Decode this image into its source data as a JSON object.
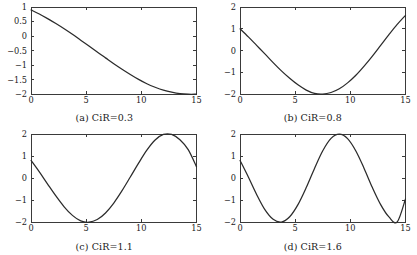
{
  "figure": {
    "panel_count": 4,
    "line_color": "#2b2b2b",
    "frame_color": "#3a3a3a",
    "background": "#ffffff"
  },
  "chart_data": [
    {
      "type": "line",
      "panel": "a",
      "title": "(a) CiR=0.3",
      "xlabel": "",
      "ylabel": "",
      "xlim": [
        0,
        15
      ],
      "ylim": [
        -2,
        1
      ],
      "xticks": [
        0,
        5,
        10,
        15
      ],
      "xticklabels": [
        "0",
        "5",
        "10",
        "15"
      ],
      "yticks": [
        1,
        0.5,
        0,
        -0.5,
        -1,
        -1.5,
        -2
      ],
      "yticklabels": [
        "1",
        "0.5",
        "0",
        "-0.5",
        "-1",
        "-1.5",
        "-2"
      ],
      "grid": false,
      "legend": null,
      "series": [
        {
          "name": "CiR=0.3",
          "x": [
            0,
            0.75,
            1.5,
            2.25,
            3,
            3.75,
            4.5,
            5.25,
            6,
            6.75,
            7.5,
            8.25,
            9,
            9.75,
            10.5,
            11.25,
            12,
            12.75,
            13.5,
            14.25,
            15
          ],
          "values": [
            0.9,
            0.76,
            0.6,
            0.43,
            0.25,
            0.06,
            -0.14,
            -0.34,
            -0.55,
            -0.75,
            -0.95,
            -1.14,
            -1.32,
            -1.49,
            -1.64,
            -1.76,
            -1.86,
            -1.93,
            -1.98,
            -2.0,
            -2.0
          ]
        }
      ]
    },
    {
      "type": "line",
      "panel": "b",
      "title": "(b) CiR=0.8",
      "xlabel": "",
      "ylabel": "",
      "xlim": [
        0,
        15
      ],
      "ylim": [
        -2,
        2
      ],
      "xticks": [
        0,
        5,
        10,
        15
      ],
      "xticklabels": [
        "0",
        "5",
        "10",
        "15"
      ],
      "yticks": [
        2,
        1,
        0,
        -1,
        -2
      ],
      "yticklabels": [
        "2",
        "1",
        "0",
        "-1",
        "-2"
      ],
      "grid": false,
      "legend": null,
      "series": [
        {
          "name": "CiR=0.8",
          "x": [
            0,
            0.75,
            1.5,
            2.25,
            3,
            3.75,
            4.5,
            5.25,
            6,
            6.75,
            7.5,
            8.25,
            9,
            9.75,
            10.5,
            11.25,
            12,
            12.75,
            13.5,
            14.25,
            15
          ],
          "values": [
            1.0,
            0.63,
            0.24,
            -0.15,
            -0.55,
            -0.93,
            -1.27,
            -1.57,
            -1.81,
            -1.96,
            -1.99,
            -1.92,
            -1.75,
            -1.48,
            -1.13,
            -0.71,
            -0.25,
            0.24,
            0.73,
            1.2,
            1.62
          ]
        }
      ]
    },
    {
      "type": "line",
      "panel": "c",
      "title": "(c) CiR=1.1",
      "xlabel": "",
      "ylabel": "",
      "xlim": [
        0,
        15
      ],
      "ylim": [
        -2,
        2
      ],
      "xticks": [
        0,
        5,
        10,
        15
      ],
      "xticklabels": [
        "0",
        "5",
        "10",
        "15"
      ],
      "yticks": [
        2,
        1,
        0,
        -1,
        -2
      ],
      "yticklabels": [
        "2",
        "1",
        "0",
        "-1",
        "-2"
      ],
      "grid": false,
      "legend": null,
      "series": [
        {
          "name": "CiR=1.1",
          "x": [
            0,
            0.75,
            1.5,
            2.25,
            3,
            3.75,
            4.5,
            5.25,
            6,
            6.75,
            7.5,
            8.25,
            9,
            9.75,
            10.5,
            11.25,
            12,
            12.75,
            13.5,
            14.25,
            15
          ],
          "values": [
            0.8,
            0.28,
            -0.27,
            -0.81,
            -1.3,
            -1.69,
            -1.94,
            -2.0,
            -1.88,
            -1.58,
            -1.13,
            -0.57,
            0.05,
            0.68,
            1.27,
            1.73,
            1.98,
            1.98,
            1.74,
            1.29,
            0.52
          ]
        }
      ]
    },
    {
      "type": "line",
      "panel": "d",
      "title": "(d) CiR=1.6",
      "xlabel": "",
      "ylabel": "",
      "xlim": [
        0,
        15
      ],
      "ylim": [
        -2,
        2
      ],
      "xticks": [
        0,
        5,
        10,
        15
      ],
      "xticklabels": [
        "0",
        "5",
        "10",
        "15"
      ],
      "yticks": [
        2,
        1,
        0,
        -1,
        -2
      ],
      "yticklabels": [
        "2",
        "1",
        "0",
        "-1",
        "-2"
      ],
      "grid": false,
      "legend": null,
      "series": [
        {
          "name": "CiR=1.6",
          "x": [
            0,
            0.75,
            1.5,
            2.25,
            3,
            3.75,
            4.5,
            5.25,
            6,
            6.75,
            7.5,
            8.25,
            9,
            9.75,
            10.5,
            11.25,
            12,
            12.75,
            13.5,
            14.25,
            15
          ],
          "values": [
            0.8,
            0.05,
            -0.74,
            -1.43,
            -1.87,
            -1.99,
            -1.75,
            -1.2,
            -0.43,
            0.44,
            1.24,
            1.8,
            1.99,
            1.79,
            1.23,
            0.44,
            -0.43,
            -1.2,
            -1.76,
            -1.99,
            -0.95
          ]
        }
      ]
    }
  ]
}
